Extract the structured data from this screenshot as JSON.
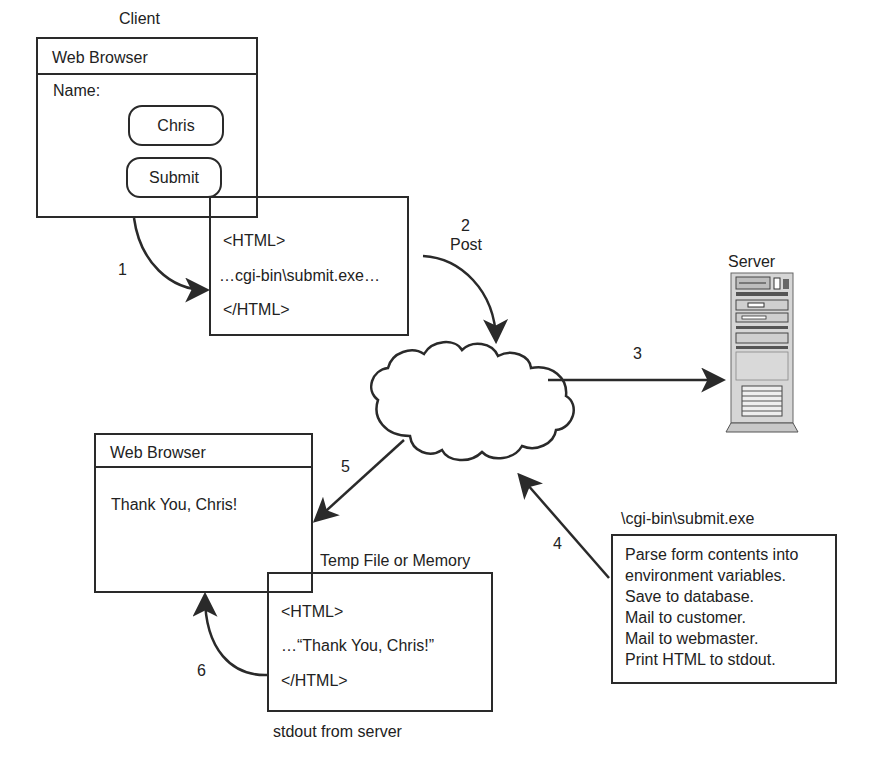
{
  "client": {
    "label": "Client",
    "browser_title": "Web Browser",
    "name_label": "Name:",
    "name_value": "Chris",
    "submit_label": "Submit"
  },
  "request_html": {
    "lines": [
      "<HTML>",
      "…cgi-bin\\submit.exe…",
      "</HTML>"
    ]
  },
  "steps": {
    "s1": "1",
    "s2": "2",
    "s2_label": "Post",
    "s3": "3",
    "s4": "4",
    "s5": "5",
    "s6": "6"
  },
  "internet": {
    "label": "Internet"
  },
  "server": {
    "label": "Server"
  },
  "result_browser": {
    "browser_title": "Web Browser",
    "message": "Thank You, Chris!"
  },
  "temp_file": {
    "label": "Temp File or Memory",
    "lines": [
      "<HTML>",
      "…“Thank You, Chris!”",
      "</HTML>"
    ],
    "caption": "stdout from server"
  },
  "cgi_program": {
    "label": "\\cgi-bin\\submit.exe",
    "lines": [
      "Parse form contents into",
      "environment variables.",
      "Save to database.",
      "Mail to customer.",
      "Mail to webmaster.",
      "Print HTML to stdout."
    ]
  },
  "colors": {
    "ink": "#2a2a2a",
    "server_gray": "#c8c8c8"
  }
}
